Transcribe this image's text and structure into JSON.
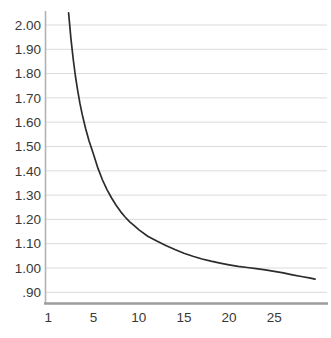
{
  "chart_data": {
    "type": "line",
    "title": "",
    "subtitle": "",
    "xlabel": "",
    "ylabel": "",
    "legend": "none",
    "grid": "horizontal-only",
    "xlim": [
      0.6,
      29.8
    ],
    "ylim": [
      0.856,
      2.06
    ],
    "x_ticks": [
      {
        "label": "1",
        "value": 1
      },
      {
        "label": "5",
        "value": 5
      },
      {
        "label": "10",
        "value": 10
      },
      {
        "label": "15",
        "value": 15
      },
      {
        "label": "20",
        "value": 20
      },
      {
        "label": "25",
        "value": 25
      }
    ],
    "y_ticks": [
      {
        "label": "2.00",
        "value": 2.0
      },
      {
        "label": "1.90",
        "value": 1.9
      },
      {
        "label": "1.80",
        "value": 1.8
      },
      {
        "label": "1.70",
        "value": 1.7
      },
      {
        "label": "1.60",
        "value": 1.6
      },
      {
        "label": "1.50",
        "value": 1.5
      },
      {
        "label": "1.40",
        "value": 1.4
      },
      {
        "label": "1.30",
        "value": 1.3
      },
      {
        "label": "1.20",
        "value": 1.2
      },
      {
        "label": "1.10",
        "value": 1.1
      },
      {
        "label": "1.00",
        "value": 1.0
      },
      {
        "label": ".90",
        "value": 0.9
      }
    ],
    "series": [
      {
        "name": "decay-curve",
        "points": [
          [
            2.8,
            2.05
          ],
          [
            2.9,
            1.995
          ],
          [
            3.0,
            1.945
          ],
          [
            3.2,
            1.86
          ],
          [
            3.4,
            1.79
          ],
          [
            3.6,
            1.73
          ],
          [
            3.8,
            1.678
          ],
          [
            4.0,
            1.632
          ],
          [
            4.3,
            1.574
          ],
          [
            4.6,
            1.524
          ],
          [
            5.0,
            1.468
          ],
          [
            5.5,
            1.41
          ],
          [
            6.0,
            1.362
          ],
          [
            6.5,
            1.322
          ],
          [
            7.0,
            1.288
          ],
          [
            7.5,
            1.258
          ],
          [
            8.0,
            1.232
          ],
          [
            8.5,
            1.21
          ],
          [
            9.0,
            1.19
          ],
          [
            9.5,
            1.174
          ],
          [
            10,
            1.158
          ],
          [
            11,
            1.131
          ],
          [
            12,
            1.111
          ],
          [
            13,
            1.093
          ],
          [
            14,
            1.076
          ],
          [
            15,
            1.061
          ],
          [
            16,
            1.048
          ],
          [
            17,
            1.037
          ],
          [
            18,
            1.028
          ],
          [
            19,
            1.02
          ],
          [
            20,
            1.013
          ],
          [
            21,
            1.007
          ],
          [
            22,
            1.002
          ],
          [
            23,
            0.997
          ],
          [
            24,
            0.992
          ],
          [
            25,
            0.986
          ],
          [
            26,
            0.98
          ],
          [
            27,
            0.972
          ],
          [
            28,
            0.965
          ],
          [
            29,
            0.958
          ],
          [
            29.5,
            0.954
          ]
        ]
      }
    ],
    "colors": {
      "background": "#ffffff",
      "curve": "#2c2c2c",
      "gridline": "#dbdbdb",
      "y_axis_line": "#b3b3b3",
      "x_axis_line": "#9d9d9d",
      "tick_text": "#383838"
    }
  }
}
